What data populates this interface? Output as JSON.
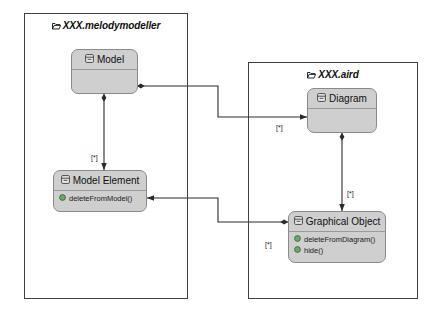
{
  "diagram": {
    "type": "uml-class-package-diagram",
    "background": "#ffffff",
    "class_fill": "#cfcfcf",
    "class_border": "#8a8a8a",
    "package_border": "#3f3f3f",
    "operation_icon_color": "#4f9a4f"
  },
  "packages": [
    {
      "id": "melodymodeller",
      "label": "XXX.melodymodeller",
      "icon": "package-icon"
    },
    {
      "id": "aird",
      "label": "XXX.aird",
      "icon": "package-icon"
    }
  ],
  "classes": [
    {
      "id": "model",
      "name": "Model",
      "icon": "class-icon",
      "members": []
    },
    {
      "id": "model-element",
      "name": "Model Element",
      "icon": "class-icon",
      "members": [
        {
          "label": "deleteFromModel()",
          "icon": "operation-icon"
        }
      ]
    },
    {
      "id": "diagram",
      "name": "Diagram",
      "icon": "class-icon",
      "members": []
    },
    {
      "id": "graphical-object",
      "name": "Graphical Object",
      "icon": "class-icon",
      "members": [
        {
          "label": "deleteFromDiagram()",
          "icon": "operation-icon"
        },
        {
          "label": "hide()",
          "icon": "operation-icon"
        }
      ]
    }
  ],
  "multiplicities": [
    {
      "id": "model-to-model-element",
      "label": "[*]"
    },
    {
      "id": "model-to-diagram",
      "label": "[*]"
    },
    {
      "id": "diagram-to-graphical-object",
      "label": "[*]"
    },
    {
      "id": "model-element-to-graphical-object",
      "label": "[*]"
    }
  ],
  "connectors": [
    {
      "id": "model-model-element",
      "from": "model",
      "to": "model-element",
      "source_end": "filled-diamond",
      "target_end": "arrow"
    },
    {
      "id": "model-diagram",
      "from": "model",
      "to": "diagram",
      "source_end": "filled-diamond",
      "target_end": "arrow"
    },
    {
      "id": "diagram-graphical-object",
      "from": "diagram",
      "to": "graphical-object",
      "source_end": "filled-diamond",
      "target_end": "arrow"
    },
    {
      "id": "graphical-object-model-element",
      "from": "graphical-object",
      "to": "model-element",
      "source_end": "filled-diamond",
      "target_end": "arrow"
    }
  ]
}
